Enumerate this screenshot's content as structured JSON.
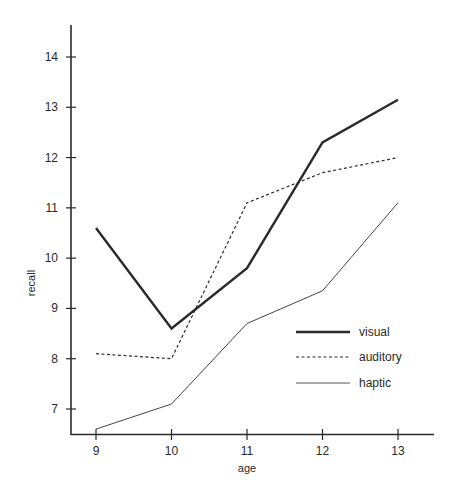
{
  "chart_data": {
    "type": "line",
    "title": "",
    "xlabel": "age",
    "ylabel": "recall",
    "x": [
      9,
      10,
      11,
      12,
      13
    ],
    "x_ticks": [
      "9",
      "10",
      "11",
      "12",
      "13"
    ],
    "y_ticks": [
      "7",
      "8",
      "9",
      "10",
      "11",
      "12",
      "13",
      "14"
    ],
    "ylim": [
      6.5,
      14.6
    ],
    "xlim": [
      8.7,
      13.5
    ],
    "grid": false,
    "legend_position": "lower right inside",
    "series": [
      {
        "name": "visual",
        "style": "solid-thick",
        "values": [
          10.6,
          8.6,
          9.8,
          12.3,
          13.15
        ]
      },
      {
        "name": "auditory",
        "style": "dashed",
        "values": [
          8.1,
          8.0,
          11.1,
          11.7,
          12.0
        ]
      },
      {
        "name": "haptic",
        "style": "solid-thin",
        "values": [
          6.6,
          7.1,
          8.7,
          9.35,
          11.1
        ]
      }
    ]
  },
  "colors": {
    "line": "#2a2a2a",
    "background": "#ffffff"
  }
}
